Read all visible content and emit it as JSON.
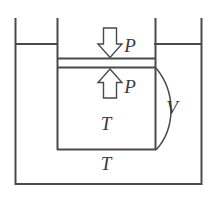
{
  "figure": {
    "type": "physics-schematic",
    "background_color": "#ffffff",
    "line_color": "#4a4a4a",
    "text_color": "#3a3a3a"
  },
  "labels": {
    "pressure_top": "P",
    "pressure_bottom": "P",
    "volume": "V",
    "temperature_gas": "T",
    "temperature_bath": "T"
  },
  "arrows": {
    "down": {
      "name": "down-arrow",
      "direction": "down",
      "label": "P",
      "style": "hollow-block"
    },
    "up": {
      "name": "up-arrow",
      "direction": "up",
      "label": "P",
      "style": "hollow-block"
    }
  },
  "parts": {
    "outer_container": "outer-container",
    "inner_cylinder": "inner-cylinder",
    "piston": "piston",
    "gas_region": "gas-region",
    "volume_brace": "volume-brace"
  }
}
